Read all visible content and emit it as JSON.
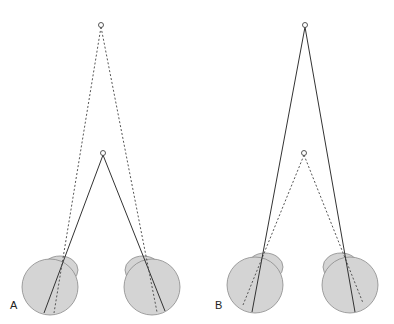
{
  "figure": {
    "panels": [
      {
        "label": "A",
        "far_target": {
          "x": 101,
          "y": 25
        },
        "near_target": {
          "x": 103,
          "y": 153
        },
        "near_lines": "solid",
        "far_lines": "dashed",
        "eyes": [
          {
            "side": "left",
            "cx": 50,
            "cy": 287,
            "r": 28,
            "cornea_cx": 60,
            "cornea_cy": 270,
            "cornea_rx": 18,
            "cornea_ry": 14,
            "solid_end": {
              "x": 44,
              "y": 313
            },
            "dashed_end": {
              "x": 54,
              "y": 313
            }
          },
          {
            "side": "right",
            "cx": 152,
            "cy": 287,
            "r": 28,
            "cornea_cx": 143,
            "cornea_cy": 270,
            "cornea_rx": 18,
            "cornea_ry": 14,
            "solid_end": {
              "x": 165,
              "y": 311
            },
            "dashed_end": {
              "x": 157,
              "y": 312
            }
          }
        ]
      },
      {
        "label": "B",
        "far_target": {
          "x": 305,
          "y": 25
        },
        "near_target": {
          "x": 304,
          "y": 153
        },
        "near_lines": "dashed",
        "far_lines": "solid",
        "eyes": [
          {
            "side": "left",
            "cx": 255,
            "cy": 285,
            "r": 28,
            "cornea_cx": 265,
            "cornea_cy": 267,
            "cornea_rx": 18,
            "cornea_ry": 14,
            "solid_end": {
              "x": 252,
              "y": 312
            },
            "dashed_end": {
              "x": 243,
              "y": 305
            }
          },
          {
            "side": "right",
            "cx": 350,
            "cy": 285,
            "r": 28,
            "cornea_cx": 341,
            "cornea_cy": 267,
            "cornea_rx": 18,
            "cornea_ry": 14,
            "solid_end": {
              "x": 355,
              "y": 312
            },
            "dashed_end": {
              "x": 363,
              "y": 303
            }
          }
        ]
      }
    ],
    "colors": {
      "eye_fill": "#d4d4d4",
      "eye_stroke": "#8a8a8a",
      "line": "#333333",
      "dashed_line": "#555555"
    }
  }
}
